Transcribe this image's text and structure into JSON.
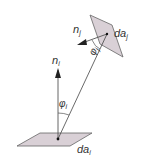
{
  "diagram": {
    "title": "",
    "colors": {
      "patch_fill": "#d9d0d6",
      "patch_stroke": "#555555",
      "line": "#444444",
      "arrow": "#222222",
      "text": "#333333"
    },
    "labels": {
      "n_i": {
        "base": "n",
        "sub": "i"
      },
      "n_j": {
        "base": "n",
        "sub": "j"
      },
      "phi_i": {
        "base": "φ",
        "sub": "i"
      },
      "phi_j": {
        "base": "φ",
        "sub": "j"
      },
      "da_i": {
        "base": "da",
        "sub": "i"
      },
      "da_j": {
        "base": "da",
        "sub": "j"
      }
    },
    "elements": {
      "patch_i": "differential area patch i (horizontal)",
      "patch_j": "differential area patch j (tilted)",
      "normal_i": "surface normal of patch i",
      "normal_j": "surface normal of patch j",
      "connecting_line": "line between patch centers"
    }
  }
}
